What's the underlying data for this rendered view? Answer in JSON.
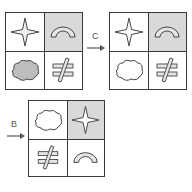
{
  "colors": {
    "border": "#3a3a3a",
    "shaded_cell": "#d9d9d9",
    "blank_cell": "#ffffff",
    "shape_fill": "#e6e6e6",
    "shape_stroke": "#444444",
    "arrow": "#555555"
  },
  "grids": [
    {
      "id": "initial",
      "cells": [
        {
          "position": "top-left",
          "shape": "four-point-star",
          "shaded": false
        },
        {
          "position": "top-right",
          "shape": "arch",
          "shaded": true
        },
        {
          "position": "bottom-left",
          "shape": "cloud",
          "shaded": false,
          "filled": true
        },
        {
          "position": "bottom-right",
          "shape": "not-equal-sign",
          "shaded": false
        }
      ]
    },
    {
      "id": "after-c",
      "cells": [
        {
          "position": "top-left",
          "shape": "four-point-star",
          "shaded": false
        },
        {
          "position": "top-right",
          "shape": "arch",
          "shaded": true
        },
        {
          "position": "bottom-left",
          "shape": "cloud",
          "shaded": false,
          "filled": false
        },
        {
          "position": "bottom-right",
          "shape": "not-equal-sign",
          "shaded": false
        }
      ]
    },
    {
      "id": "after-b",
      "cells": [
        {
          "position": "top-left",
          "shape": "cloud",
          "shaded": false,
          "filled": false
        },
        {
          "position": "top-right",
          "shape": "four-point-star",
          "shaded": true
        },
        {
          "position": "bottom-left",
          "shape": "not-equal-sign",
          "shaded": false
        },
        {
          "position": "bottom-right",
          "shape": "arch",
          "shaded": false
        }
      ]
    }
  ],
  "transforms": [
    {
      "label": "C",
      "from": "initial",
      "to": "after-c"
    },
    {
      "label": "B",
      "to": "after-b"
    }
  ]
}
